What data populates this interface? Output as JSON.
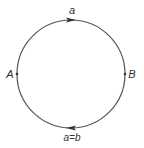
{
  "diagram": {
    "type": "circle-path",
    "circle": {
      "cx": 71,
      "cy": 74,
      "r": 54,
      "stroke": "#555555"
    },
    "labels": {
      "top": "a",
      "left": "A",
      "right": "B",
      "bottom": "a=b"
    },
    "points": [
      {
        "name": "A",
        "x": 17,
        "y": 74
      },
      {
        "name": "B",
        "x": 125,
        "y": 74
      }
    ],
    "arrows": [
      {
        "position": "top",
        "direction": "right"
      },
      {
        "position": "bottom",
        "direction": "left"
      }
    ]
  }
}
